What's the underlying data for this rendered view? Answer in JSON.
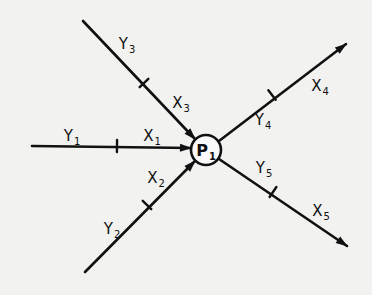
{
  "diagram": {
    "type": "node-flow",
    "node": {
      "id": "P1",
      "label_main": "P",
      "label_sub": "1",
      "cx": 206,
      "cy": 150,
      "r": 15
    },
    "edges": [
      {
        "id": "edge-1",
        "direction": "in",
        "from": [
          32,
          146
        ],
        "to": [
          191,
          148
        ],
        "tick": [
          117,
          146
        ],
        "tick_angle": 90
      },
      {
        "id": "edge-2",
        "direction": "in",
        "from": [
          85,
          272
        ],
        "to": [
          195,
          161
        ],
        "tick": [
          147,
          205
        ],
        "tick_angle": -45
      },
      {
        "id": "edge-3",
        "direction": "in",
        "from": [
          83,
          21
        ],
        "to": [
          195,
          139
        ],
        "tick": [
          144,
          83
        ],
        "tick_angle": 45
      },
      {
        "id": "edge-4",
        "direction": "out",
        "from": [
          219,
          141
        ],
        "to": [
          346,
          44
        ],
        "tick": [
          272,
          95
        ],
        "tick_angle": -37
      },
      {
        "id": "edge-5",
        "direction": "out",
        "from": [
          219,
          159
        ],
        "to": [
          347,
          246
        ],
        "tick": [
          273,
          192
        ],
        "tick_angle": 34
      }
    ],
    "labels": [
      {
        "id": "Y1",
        "main": "Y",
        "sub": "1",
        "x": 72,
        "y": 136
      },
      {
        "id": "X1",
        "main": "X",
        "sub": "1",
        "x": 152,
        "y": 136
      },
      {
        "id": "Y2",
        "main": "Y",
        "sub": "2",
        "x": 112,
        "y": 229
      },
      {
        "id": "X2",
        "main": "X",
        "sub": "2",
        "x": 156,
        "y": 178
      },
      {
        "id": "Y3",
        "main": "Y",
        "sub": "3",
        "x": 127,
        "y": 44
      },
      {
        "id": "X3",
        "main": "X",
        "sub": "3",
        "x": 181,
        "y": 103
      },
      {
        "id": "Y4",
        "main": "Y",
        "sub": "4",
        "x": 263,
        "y": 120
      },
      {
        "id": "X4",
        "main": "X",
        "sub": "4",
        "x": 320,
        "y": 86
      },
      {
        "id": "Y5",
        "main": "Y",
        "sub": "5",
        "x": 264,
        "y": 168
      },
      {
        "id": "X5",
        "main": "X",
        "sub": "5",
        "x": 321,
        "y": 211
      }
    ]
  }
}
